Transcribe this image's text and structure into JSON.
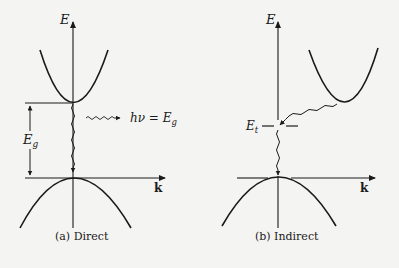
{
  "diagram": {
    "type": "band-structure-comparison",
    "colors": {
      "ink": "#1a1a1a",
      "background": "#f4f4f2"
    },
    "panels": [
      {
        "id": "direct",
        "caption": "(a) Direct",
        "axis_y_label": "E",
        "axis_x_label": "k",
        "gap_label": "E",
        "gap_label_sub": "g",
        "photon_label": "hν = E",
        "photon_label_sub": "g"
      },
      {
        "id": "indirect",
        "caption": "(b) Indirect",
        "axis_y_label": "E",
        "axis_x_label": "k",
        "trap_label": "E",
        "trap_label_sub": "t"
      }
    ]
  }
}
